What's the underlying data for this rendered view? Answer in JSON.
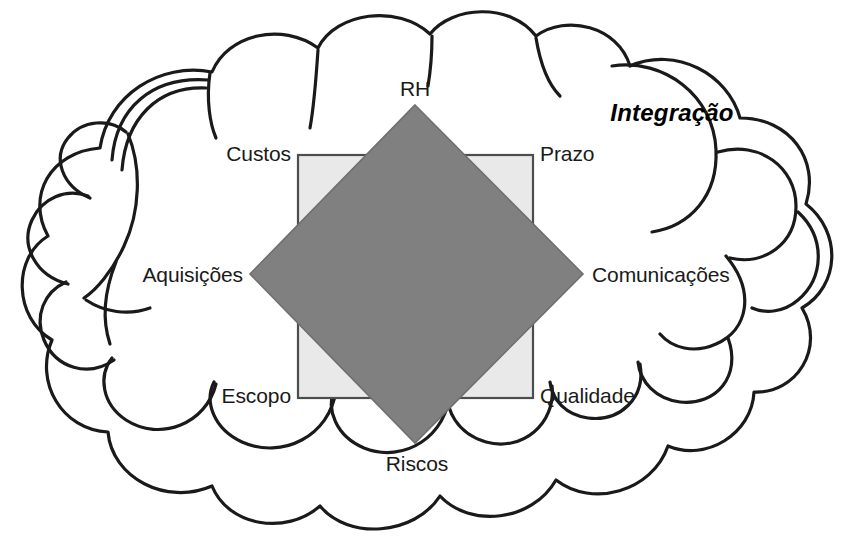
{
  "diagram": {
    "title": "Integração",
    "title_style": "bold-italic",
    "cloud": {
      "name": "cloud-outline",
      "stroke_color": "#1a1a1a",
      "fill_color": "#ffffff",
      "stroke_width": 3
    },
    "square": {
      "name": "quality-square",
      "fill_color": "#e9e9e9",
      "stroke_color": "#4d4d4d",
      "x": 298,
      "y": 155,
      "width": 235,
      "height": 243
    },
    "diamond": {
      "name": "knowledge-diamond",
      "fill_color": "#808080",
      "stroke_color": "#6b6b6b",
      "top": [
        415,
        105
      ],
      "right": [
        583,
        274
      ],
      "bottom": [
        415,
        443
      ],
      "left": [
        250,
        274
      ]
    },
    "labels": [
      {
        "id": "rh",
        "text": "RH",
        "x": 415,
        "y": 89,
        "align": "center"
      },
      {
        "id": "custos",
        "text": "Custos",
        "x": 291,
        "y": 155,
        "align": "right"
      },
      {
        "id": "prazo",
        "text": "Prazo",
        "x": 540,
        "y": 155,
        "align": "left"
      },
      {
        "id": "aquisicoes",
        "text": "Aquisições",
        "x": 243,
        "y": 274,
        "align": "right"
      },
      {
        "id": "comunicacoes",
        "text": "Comunicações",
        "x": 592,
        "y": 274,
        "align": "left"
      },
      {
        "id": "escopo",
        "text": "Escopo",
        "x": 291,
        "y": 397,
        "align": "right"
      },
      {
        "id": "qualidade",
        "text": "Qualidade",
        "x": 540,
        "y": 397,
        "align": "left"
      },
      {
        "id": "riscos",
        "text": "Riscos",
        "x": 417,
        "y": 464,
        "align": "center"
      }
    ],
    "title_position": {
      "x": 672,
      "y": 113
    }
  }
}
